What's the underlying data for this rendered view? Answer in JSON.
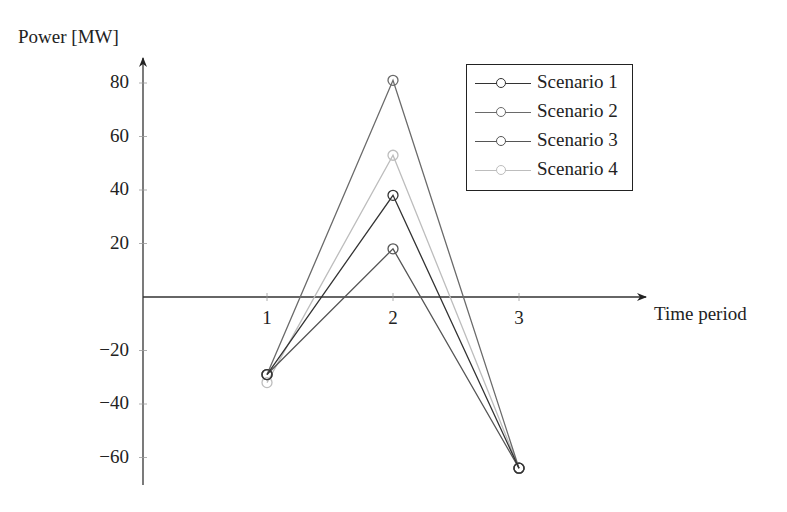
{
  "chart_data": {
    "type": "line",
    "title": "",
    "xlabel": "Time period",
    "ylabel": "Power [MW]",
    "x": [
      1,
      2,
      3
    ],
    "x_tick_labels": [
      "1",
      "2",
      "3"
    ],
    "y_tick_values": [
      80,
      60,
      40,
      20,
      -20,
      -40,
      -60
    ],
    "y_tick_labels": [
      "80",
      "60",
      "40",
      "20",
      "−20",
      "−40",
      "−60"
    ],
    "ylim": [
      -70,
      85
    ],
    "grid": false,
    "legend_position": "upper right",
    "series": [
      {
        "name": "Scenario 1",
        "values": [
          -29,
          38,
          -64
        ],
        "color": "#333333",
        "marker": "circle"
      },
      {
        "name": "Scenario 2",
        "values": [
          -29,
          81,
          -64
        ],
        "color": "#6a6a6a",
        "marker": "circle"
      },
      {
        "name": "Scenario 3",
        "values": [
          -29,
          18,
          -64
        ],
        "color": "#555555",
        "marker": "circle"
      },
      {
        "name": "Scenario 4",
        "values": [
          -32,
          53,
          -64
        ],
        "color": "#bdbdbd",
        "marker": "circle"
      }
    ]
  }
}
